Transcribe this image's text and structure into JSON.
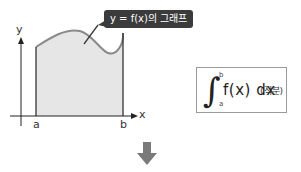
{
  "diagram": {
    "callout_label": "y = f(x)의 그래프",
    "axis_labels": {
      "y": "y",
      "x": "x"
    },
    "interval_labels": {
      "a": "a",
      "b": "b"
    },
    "formula": {
      "integral_sign": "∫",
      "upper_limit": "b",
      "lower_limit": "a",
      "integrand": "f(x) dx",
      "annotation": "(적분)"
    },
    "colors": {
      "fill": "#e6e6e6",
      "curve": "#8a8a8a",
      "axis": "#222222",
      "callout_bg": "#3b3b3b",
      "arrow": "#7a7a7a"
    },
    "arrow_icon": "down-arrow-icon"
  }
}
